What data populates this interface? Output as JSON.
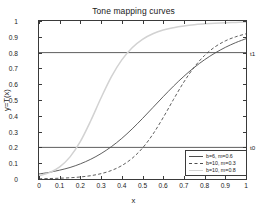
{
  "chart_data": {
    "type": "line",
    "title": "Tone mapping curves",
    "xlabel": "x",
    "ylabel": "y=T(x)",
    "xlim": [
      0,
      1
    ],
    "ylim": [
      0,
      1
    ],
    "grid": false,
    "legend_position": "lower right",
    "xticks": [
      "0",
      "0.1",
      "0.2",
      "0.3",
      "0.4",
      "0.5",
      "0.6",
      "0.7",
      "0.8",
      "0.9",
      "1"
    ],
    "xtick_values": [
      0,
      0.1,
      0.2,
      0.3,
      0.4,
      0.5,
      0.6,
      0.7,
      0.8,
      0.9,
      1
    ],
    "yticks": [
      "0",
      "0.1",
      "0.2",
      "0.3",
      "0.4",
      "0.5",
      "0.6",
      "0.7",
      "0.8",
      "0.9",
      "1"
    ],
    "ytick_values": [
      0,
      0.1,
      0.2,
      0.3,
      0.4,
      0.5,
      0.6,
      0.7,
      0.8,
      0.9,
      1
    ],
    "series": [
      {
        "name": "b=6, m=0.6",
        "style": "solid",
        "color": "#4d4d4d",
        "b": 6,
        "m": 0.6,
        "x": [
          0,
          0.05,
          0.1,
          0.15,
          0.2,
          0.25,
          0.3,
          0.35,
          0.4,
          0.45,
          0.5,
          0.55,
          0.6,
          0.65,
          0.7,
          0.75,
          0.8,
          0.85,
          0.9,
          0.95,
          1
        ],
        "values": [
          0.032,
          0.042,
          0.056,
          0.073,
          0.096,
          0.125,
          0.161,
          0.205,
          0.257,
          0.317,
          0.383,
          0.452,
          0.521,
          0.588,
          0.65,
          0.706,
          0.755,
          0.797,
          0.833,
          0.863,
          0.888
        ]
      },
      {
        "name": "b=10, m=0.3",
        "style": "dashed",
        "color": "#4d4d4d",
        "b": 10,
        "m": 0.3,
        "x": [
          0,
          0.05,
          0.1,
          0.15,
          0.2,
          0.25,
          0.3,
          0.35,
          0.4,
          0.45,
          0.5,
          0.55,
          0.6,
          0.65,
          0.7,
          0.75,
          0.8,
          0.85,
          0.9,
          0.95,
          1
        ],
        "values": [
          0.002,
          0.003,
          0.005,
          0.008,
          0.013,
          0.021,
          0.034,
          0.054,
          0.085,
          0.131,
          0.196,
          0.283,
          0.389,
          0.504,
          0.614,
          0.708,
          0.782,
          0.836,
          0.874,
          0.9,
          0.919
        ]
      },
      {
        "name": "b=10, m=0.8",
        "style": "solid-light",
        "color": "#d2d2d2",
        "b": 10,
        "m": 0.8,
        "x": [
          0,
          0.05,
          0.1,
          0.15,
          0.2,
          0.25,
          0.3,
          0.35,
          0.4,
          0.45,
          0.5,
          0.55,
          0.6,
          0.65,
          0.7,
          0.75,
          0.8,
          0.85,
          0.9,
          0.95,
          1
        ],
        "values": [
          0.02,
          0.04,
          0.077,
          0.14,
          0.238,
          0.369,
          0.514,
          0.648,
          0.754,
          0.831,
          0.884,
          0.919,
          0.943,
          0.958,
          0.969,
          0.977,
          0.982,
          0.986,
          0.989,
          0.991,
          0.993
        ]
      }
    ],
    "threshold_lines": [
      {
        "label": "t0",
        "value": 0.2,
        "color": "#4d4d4d"
      },
      {
        "label": "t1",
        "value": 0.8,
        "color": "#4d4d4d"
      }
    ]
  }
}
